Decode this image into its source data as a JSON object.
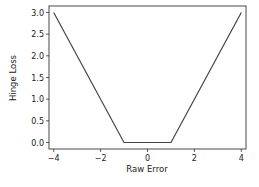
{
  "chart_data": {
    "type": "line",
    "title": "",
    "xlabel": "Raw Error",
    "ylabel": "Hinge Loss",
    "xlim": [
      -4.2,
      4.2
    ],
    "ylim": [
      -0.15,
      3.15
    ],
    "grid": false,
    "legend": null,
    "x_ticks": [
      -4,
      -2,
      0,
      2,
      4
    ],
    "x_tick_labels": [
      "−4",
      "−2",
      "0",
      "2",
      "4"
    ],
    "y_ticks": [
      0.0,
      0.5,
      1.0,
      1.5,
      2.0,
      2.5,
      3.0
    ],
    "y_tick_labels": [
      "0.0",
      "0.5",
      "1.0",
      "1.5",
      "2.0",
      "2.5",
      "3.0"
    ],
    "series": [
      {
        "name": "Hinge Loss",
        "color": "#444444",
        "x": [
          -4,
          -1,
          1,
          4
        ],
        "y": [
          3.0,
          0.0,
          0.0,
          3.0
        ]
      }
    ]
  }
}
